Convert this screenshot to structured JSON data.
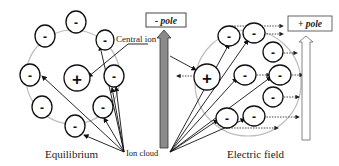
{
  "labels": {
    "central_ion": "Central ion",
    "neg_pole": "- pole",
    "pos_pole": "+ pole",
    "equilibrium": "Equilibrium",
    "ion_cloud": "Ion cloud",
    "electric_field": "Electric field"
  },
  "signs": {
    "positive": "+",
    "negative": "-"
  },
  "colors": {
    "cloud_circle": "#bdbdbd",
    "neg_pole_arrow": "#8a8a8a",
    "pos_pole_arrow": "#ffffff",
    "stroke": "#111111"
  }
}
